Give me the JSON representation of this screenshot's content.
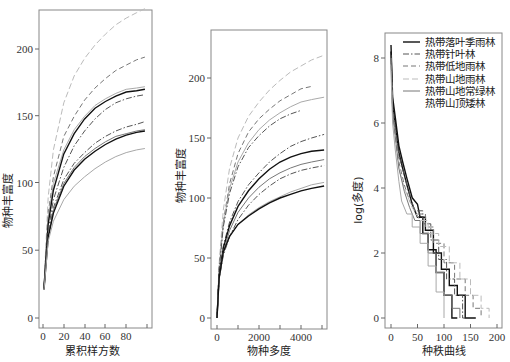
{
  "chart_data": [
    {
      "type": "line",
      "title": "",
      "xlabel": "累积样方数",
      "ylabel": "物种丰富度",
      "xlim": [
        0,
        100
      ],
      "ylim": [
        -5,
        230
      ],
      "xticks": [
        0,
        20,
        40,
        60,
        80
      ],
      "yticks": [
        0,
        50,
        100,
        150,
        200
      ],
      "grid": false,
      "x": [
        1,
        5,
        10,
        20,
        30,
        40,
        50,
        60,
        70,
        80,
        90,
        98
      ],
      "series": [
        {
          "name": "热带山地雨林",
          "style": "dash-light",
          "values": [
            25,
            90,
            125,
            160,
            180,
            193,
            203,
            211,
            218,
            223,
            227,
            230
          ]
        },
        {
          "name": "热带低地雨林",
          "style": "dash-mid",
          "values": [
            24,
            78,
            105,
            135,
            150,
            162,
            171,
            178,
            184,
            188,
            192,
            194
          ]
        },
        {
          "name": "热带山地雨林",
          "style": "light-solid",
          "values": [
            24,
            75,
            100,
            125,
            140,
            150,
            158,
            163,
            167,
            170,
            171,
            172
          ]
        },
        {
          "name": "热带落叶季雨林",
          "style": "solid-black",
          "values": [
            22,
            70,
            95,
            122,
            137,
            148,
            156,
            161,
            165,
            168,
            169,
            170
          ]
        },
        {
          "name": "热带针叶林",
          "style": "dashdot",
          "values": [
            22,
            65,
            88,
            112,
            128,
            139,
            148,
            155,
            160,
            163,
            165,
            166
          ]
        },
        {
          "name": "热带针叶林",
          "style": "dashdot",
          "values": [
            22,
            62,
            82,
            103,
            115,
            123,
            130,
            135,
            139,
            142,
            144,
            146
          ]
        },
        {
          "name": "热带山地常绿林",
          "style": "gray-solid",
          "values": [
            22,
            61,
            80,
            100,
            112,
            120,
            126,
            131,
            135,
            137,
            139,
            140
          ]
        },
        {
          "name": "热带落叶季雨林",
          "style": "solid-black",
          "values": [
            21,
            60,
            78,
            98,
            110,
            118,
            124,
            129,
            133,
            136,
            138,
            139
          ]
        },
        {
          "name": "热带山顶矮林",
          "style": "light-gray",
          "values": [
            21,
            57,
            72,
            88,
            98,
            105,
            111,
            116,
            120,
            123,
            125,
            126
          ]
        }
      ]
    },
    {
      "type": "line",
      "title": "",
      "xlabel": "物种多度",
      "ylabel": "物种丰富度",
      "xlim": [
        0,
        5200
      ],
      "ylim": [
        -5,
        240
      ],
      "xticks": [
        0,
        2000,
        4000
      ],
      "xminor_ticks": [
        1000,
        3000,
        5000
      ],
      "yticks": [
        0,
        50,
        100,
        150,
        200
      ],
      "grid": false,
      "x": [
        0,
        100,
        300,
        600,
        1000,
        1500,
        2000,
        2500,
        3000,
        3500,
        4000,
        4500,
        5100
      ],
      "series": [
        {
          "name": "热带山地雨林",
          "style": "dash-light",
          "values": [
            0,
            45,
            90,
            125,
            150,
            168,
            180,
            190,
            198,
            205,
            210,
            215,
            219
          ]
        },
        {
          "name": "热带低地雨林",
          "style": "dash-mid",
          "values": [
            0,
            42,
            80,
            112,
            137,
            155,
            166,
            174,
            181,
            186,
            191,
            193,
            null
          ]
        },
        {
          "name": "热带山地雨林",
          "style": "light-solid",
          "values": [
            0,
            40,
            78,
            108,
            130,
            146,
            157,
            165,
            171,
            176,
            180,
            182,
            184
          ]
        },
        {
          "name": "热带针叶林",
          "style": "dashdot",
          "values": [
            0,
            40,
            76,
            104,
            126,
            142,
            152,
            160,
            166,
            170,
            173,
            null,
            null
          ]
        },
        {
          "name": "热带针叶林",
          "style": "dashdot",
          "values": [
            0,
            35,
            60,
            80,
            97,
            111,
            121,
            130,
            137,
            143,
            147,
            150,
            153
          ]
        },
        {
          "name": "热带落叶季雨林",
          "style": "solid-black",
          "values": [
            0,
            35,
            58,
            77,
            93,
            106,
            116,
            124,
            130,
            134,
            137,
            139,
            140
          ]
        },
        {
          "name": "热带山地常绿林",
          "style": "gray-solid",
          "values": [
            0,
            33,
            55,
            73,
            88,
            100,
            109,
            116,
            121,
            125,
            128,
            130,
            132
          ]
        },
        {
          "name": "热带针叶林",
          "style": "dashdot",
          "values": [
            0,
            32,
            52,
            68,
            82,
            94,
            103,
            110,
            116,
            120,
            123,
            125,
            127
          ]
        },
        {
          "name": "热带山顶矮林",
          "style": "light-gray",
          "values": [
            0,
            33,
            54,
            68,
            78,
            86,
            92,
            97,
            101,
            105,
            108,
            111,
            113
          ]
        },
        {
          "name": "热带落叶季雨林",
          "style": "solid-black",
          "values": [
            0,
            33,
            55,
            68,
            78,
            85,
            91,
            96,
            100,
            103,
            106,
            108,
            110
          ]
        }
      ]
    },
    {
      "type": "line",
      "title": "",
      "xlabel": "种秩曲线",
      "ylabel": "log(多度)",
      "xlim": [
        -5,
        210
      ],
      "ylim": [
        -0.3,
        8.6
      ],
      "xticks": [
        0,
        50,
        100,
        150,
        200
      ],
      "yticks": [
        0,
        2,
        4,
        6,
        8
      ],
      "grid": false,
      "legend": {
        "position": "upper right",
        "entries": [
          {
            "label": "热带落叶季雨林",
            "style": "solid-black"
          },
          {
            "label": "热带针叶林",
            "style": "dashdot"
          },
          {
            "label": "热带低地雨林",
            "style": "dash-mid"
          },
          {
            "label": "热带山地雨林",
            "style": "dash-light"
          },
          {
            "label": "热带山地常绿林",
            "style": "gray-solid"
          },
          {
            "label": "热带山顶矮林",
            "style": "light-gray"
          }
        ]
      },
      "series": [
        {
          "name": "热带落叶季雨林",
          "style": "solid-black",
          "x": [
            0,
            3,
            8,
            15,
            22,
            30,
            40,
            50,
            55,
            65,
            80,
            95,
            110,
            125,
            140,
            160
          ],
          "values": [
            8.4,
            6.8,
            6.2,
            5.3,
            4.8,
            4.3,
            3.7,
            3.5,
            3.1,
            2.7,
            2.0,
            1.5,
            1.0,
            0.7,
            0.0,
            0.0
          ]
        },
        {
          "name": "热带落叶季雨林",
          "style": "solid-black",
          "x": [
            0,
            3,
            8,
            15,
            22,
            30,
            40,
            50,
            60,
            70,
            85,
            100,
            115,
            125
          ],
          "values": [
            8.2,
            6.6,
            6.0,
            5.1,
            4.6,
            4.1,
            3.5,
            3.1,
            2.6,
            2.1,
            1.4,
            0.7,
            0.0,
            0.0
          ]
        },
        {
          "name": "热带针叶林",
          "style": "dashdot",
          "x": [
            0,
            3,
            8,
            15,
            25,
            35,
            45,
            60,
            75,
            90,
            105,
            120,
            135,
            145
          ],
          "values": [
            8.1,
            6.5,
            5.9,
            5.0,
            4.4,
            3.8,
            3.3,
            2.9,
            2.4,
            1.8,
            1.2,
            0.7,
            0.0,
            0.0
          ]
        },
        {
          "name": "热带低地雨林",
          "style": "dash-mid",
          "x": [
            0,
            3,
            8,
            15,
            25,
            35,
            50,
            65,
            80,
            100,
            120,
            140,
            155,
            170
          ],
          "values": [
            8.0,
            6.4,
            5.7,
            4.8,
            4.1,
            3.6,
            3.2,
            2.8,
            2.3,
            1.7,
            1.2,
            0.7,
            0.3,
            0.0
          ]
        },
        {
          "name": "热带山地雨林",
          "style": "dash-light",
          "x": [
            0,
            3,
            8,
            15,
            25,
            40,
            55,
            70,
            90,
            110,
            130,
            150,
            170,
            185
          ],
          "values": [
            7.8,
            6.2,
            5.5,
            4.6,
            4.0,
            3.4,
            3.0,
            2.6,
            2.2,
            1.7,
            1.2,
            0.7,
            0.3,
            0.0
          ]
        },
        {
          "name": "热带山地常绿林",
          "style": "gray-solid",
          "x": [
            0,
            3,
            8,
            15,
            25,
            35,
            45,
            55,
            70,
            85,
            100,
            115,
            130
          ],
          "values": [
            8.0,
            6.3,
            5.6,
            4.6,
            3.9,
            3.4,
            3.0,
            2.6,
            2.0,
            1.4,
            0.7,
            0.3,
            0.0
          ]
        },
        {
          "name": "热带山顶矮林",
          "style": "light-gray",
          "x": [
            0,
            3,
            8,
            15,
            20,
            30,
            40,
            55,
            70,
            85,
            100
          ],
          "values": [
            7.6,
            6.0,
            5.2,
            4.2,
            3.6,
            3.2,
            2.8,
            2.3,
            1.6,
            0.8,
            0.0
          ]
        }
      ]
    }
  ],
  "panels": [
    {
      "xlabel": "累积样方数",
      "ylabel": "物种丰富度",
      "xtick_labels": [
        "0",
        "20",
        "40",
        "60",
        "80"
      ],
      "ytick_labels": [
        "0",
        "50",
        "100",
        "150",
        "200"
      ]
    },
    {
      "xlabel": "物种多度",
      "ylabel": "物种丰富度",
      "xtick_labels": [
        "0",
        "2000",
        "4000"
      ],
      "ytick_labels": [
        "0",
        "50",
        "100",
        "150",
        "200"
      ]
    },
    {
      "xlabel": "种秩曲线",
      "ylabel": "log(多度)",
      "xtick_labels": [
        "0",
        "50",
        "100",
        "150",
        "200"
      ],
      "ytick_labels": [
        "0",
        "2",
        "4",
        "6",
        "8"
      ]
    }
  ],
  "legend": {
    "items": [
      "热带落叶季雨林",
      "热带针叶林",
      "热带低地雨林",
      "热带山地雨林",
      "热带山地常绿林",
      "热带山顶矮林"
    ]
  },
  "styles": {
    "solid-black": {
      "color": "#111111",
      "dash": "",
      "width": 1.4
    },
    "dashdot": {
      "color": "#555555",
      "dash": "6,2,1.5,2",
      "width": 1.0
    },
    "dash-mid": {
      "color": "#777777",
      "dash": "5,3",
      "width": 1.0
    },
    "dash-light": {
      "color": "#bbbbbb",
      "dash": "6,3",
      "width": 1.0
    },
    "gray-solid": {
      "color": "#777777",
      "dash": "",
      "width": 1.0
    },
    "light-solid": {
      "color": "#aaaaaa",
      "dash": "",
      "width": 1.0
    },
    "light-gray": {
      "color": "#a8a8a8",
      "dash": "",
      "width": 1.0
    }
  }
}
